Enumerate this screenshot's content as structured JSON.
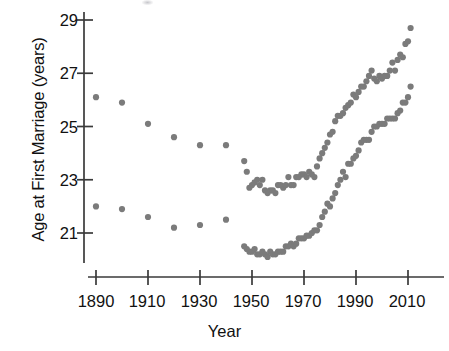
{
  "chart_data": {
    "type": "scatter",
    "title": "",
    "xlabel": "Year",
    "ylabel": "Age at First Marriage (years)",
    "xlim": [
      1884,
      2016
    ],
    "ylim": [
      19.7,
      29.3
    ],
    "xticks": [
      1890,
      1910,
      1930,
      1950,
      1970,
      1990,
      2010
    ],
    "yticks": [
      21,
      23,
      25,
      27,
      29
    ],
    "grid": false,
    "legend": null,
    "marker": "filled-circle",
    "marker_color": "#7b7b7b",
    "axis_color": "#3a3a3a",
    "series": [
      {
        "name": "men",
        "color": "#7b7b7b",
        "points": [
          [
            1890,
            26.1
          ],
          [
            1900,
            25.9
          ],
          [
            1910,
            25.1
          ],
          [
            1920,
            24.6
          ],
          [
            1930,
            24.3
          ],
          [
            1940,
            24.3
          ],
          [
            1947,
            23.7
          ],
          [
            1948,
            23.3
          ],
          [
            1949,
            22.7
          ],
          [
            1950,
            22.8
          ],
          [
            1951,
            22.9
          ],
          [
            1952,
            23.0
          ],
          [
            1953,
            22.8
          ],
          [
            1954,
            23.0
          ],
          [
            1955,
            22.6
          ],
          [
            1956,
            22.5
          ],
          [
            1957,
            22.6
          ],
          [
            1958,
            22.6
          ],
          [
            1959,
            22.5
          ],
          [
            1960,
            22.8
          ],
          [
            1961,
            22.8
          ],
          [
            1962,
            22.7
          ],
          [
            1963,
            22.8
          ],
          [
            1964,
            23.1
          ],
          [
            1965,
            22.8
          ],
          [
            1966,
            22.8
          ],
          [
            1967,
            23.1
          ],
          [
            1968,
            23.1
          ],
          [
            1969,
            23.2
          ],
          [
            1970,
            23.2
          ],
          [
            1971,
            23.1
          ],
          [
            1972,
            23.3
          ],
          [
            1973,
            23.2
          ],
          [
            1974,
            23.1
          ],
          [
            1975,
            23.5
          ],
          [
            1976,
            23.8
          ],
          [
            1977,
            24.0
          ],
          [
            1978,
            24.2
          ],
          [
            1979,
            24.4
          ],
          [
            1980,
            24.7
          ],
          [
            1981,
            24.8
          ],
          [
            1982,
            25.2
          ],
          [
            1983,
            25.4
          ],
          [
            1984,
            25.4
          ],
          [
            1985,
            25.5
          ],
          [
            1986,
            25.7
          ],
          [
            1987,
            25.8
          ],
          [
            1988,
            25.9
          ],
          [
            1989,
            26.2
          ],
          [
            1990,
            26.1
          ],
          [
            1991,
            26.3
          ],
          [
            1992,
            26.5
          ],
          [
            1993,
            26.5
          ],
          [
            1994,
            26.7
          ],
          [
            1995,
            26.9
          ],
          [
            1996,
            27.1
          ],
          [
            1997,
            26.8
          ],
          [
            1998,
            26.7
          ],
          [
            1999,
            26.9
          ],
          [
            2000,
            26.8
          ],
          [
            2001,
            26.9
          ],
          [
            2002,
            26.9
          ],
          [
            2003,
            27.1
          ],
          [
            2004,
            27.4
          ],
          [
            2005,
            27.1
          ],
          [
            2006,
            27.5
          ],
          [
            2007,
            27.7
          ],
          [
            2008,
            27.6
          ],
          [
            2009,
            28.1
          ],
          [
            2010,
            28.2
          ],
          [
            2011,
            28.7
          ]
        ]
      },
      {
        "name": "women",
        "color": "#7b7b7b",
        "points": [
          [
            1890,
            22.0
          ],
          [
            1900,
            21.9
          ],
          [
            1910,
            21.6
          ],
          [
            1920,
            21.2
          ],
          [
            1930,
            21.3
          ],
          [
            1940,
            21.5
          ],
          [
            1947,
            20.5
          ],
          [
            1948,
            20.4
          ],
          [
            1949,
            20.3
          ],
          [
            1950,
            20.3
          ],
          [
            1951,
            20.4
          ],
          [
            1952,
            20.2
          ],
          [
            1953,
            20.2
          ],
          [
            1954,
            20.3
          ],
          [
            1955,
            20.2
          ],
          [
            1956,
            20.1
          ],
          [
            1957,
            20.3
          ],
          [
            1958,
            20.2
          ],
          [
            1959,
            20.2
          ],
          [
            1960,
            20.3
          ],
          [
            1961,
            20.3
          ],
          [
            1962,
            20.3
          ],
          [
            1963,
            20.5
          ],
          [
            1964,
            20.5
          ],
          [
            1965,
            20.6
          ],
          [
            1966,
            20.5
          ],
          [
            1967,
            20.6
          ],
          [
            1968,
            20.8
          ],
          [
            1969,
            20.8
          ],
          [
            1970,
            20.8
          ],
          [
            1971,
            20.9
          ],
          [
            1972,
            20.9
          ],
          [
            1973,
            21.0
          ],
          [
            1974,
            21.1
          ],
          [
            1975,
            21.1
          ],
          [
            1976,
            21.3
          ],
          [
            1977,
            21.6
          ],
          [
            1978,
            21.8
          ],
          [
            1979,
            22.1
          ],
          [
            1980,
            22.0
          ],
          [
            1981,
            22.3
          ],
          [
            1982,
            22.5
          ],
          [
            1983,
            22.8
          ],
          [
            1984,
            23.0
          ],
          [
            1985,
            23.3
          ],
          [
            1986,
            23.1
          ],
          [
            1987,
            23.6
          ],
          [
            1988,
            23.6
          ],
          [
            1989,
            23.8
          ],
          [
            1990,
            23.9
          ],
          [
            1991,
            24.1
          ],
          [
            1992,
            24.4
          ],
          [
            1993,
            24.5
          ],
          [
            1994,
            24.5
          ],
          [
            1995,
            24.5
          ],
          [
            1996,
            24.8
          ],
          [
            1997,
            25.0
          ],
          [
            1998,
            25.0
          ],
          [
            1999,
            25.1
          ],
          [
            2000,
            25.1
          ],
          [
            2001,
            25.1
          ],
          [
            2002,
            25.3
          ],
          [
            2003,
            25.3
          ],
          [
            2004,
            25.3
          ],
          [
            2005,
            25.3
          ],
          [
            2006,
            25.5
          ],
          [
            2007,
            25.6
          ],
          [
            2008,
            25.9
          ],
          [
            2009,
            25.9
          ],
          [
            2010,
            26.1
          ],
          [
            2011,
            26.5
          ]
        ]
      }
    ]
  },
  "axis": {
    "ytick_labels": [
      "29",
      "27",
      "25",
      "23",
      "21"
    ],
    "xtick_labels": [
      "1890",
      "1910",
      "1930",
      "1950",
      "1970",
      "1990",
      "2010"
    ]
  }
}
